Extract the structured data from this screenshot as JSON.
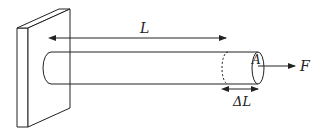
{
  "diagram": {
    "labels": {
      "length": "L",
      "area": "A",
      "force": "F",
      "elongation": "ΔL"
    },
    "colors": {
      "stroke": "#222222",
      "background": "#ffffff"
    }
  }
}
